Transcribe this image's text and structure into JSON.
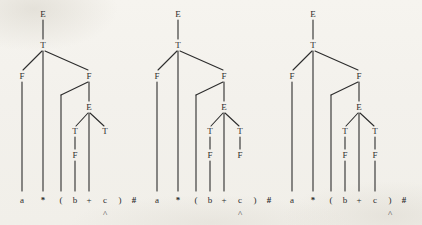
{
  "figure": {
    "background_color": "#f4f2ed",
    "ink_color": "#2c2c2c",
    "width": 422,
    "height": 225,
    "stage_count": 3
  },
  "grammar_symbols": {
    "E": "E",
    "T": "T",
    "F": "F"
  },
  "terminals": {
    "a": "a",
    "star": "*",
    "lparen": "(",
    "b": "b",
    "plus": "+",
    "c": "c",
    "rparen": ")",
    "end": "#"
  },
  "caret_marker": "^",
  "trees": [
    {
      "id": "tree-1",
      "x_offset": 0,
      "caret_under": "c",
      "nodes": [
        {
          "name": "root-E",
          "label": "E",
          "x": 43,
          "y": 14
        },
        {
          "name": "T-under-root",
          "label": "T",
          "x": 43,
          "y": 45
        },
        {
          "name": "F-left",
          "label": "F",
          "x": 22,
          "y": 76
        },
        {
          "name": "F-right",
          "label": "F",
          "x": 89,
          "y": 76
        },
        {
          "name": "E-inner",
          "label": "E",
          "x": 89,
          "y": 107
        },
        {
          "name": "T-inner-left",
          "label": "T",
          "x": 75,
          "y": 131
        },
        {
          "name": "T-inner-right",
          "label": "T",
          "x": 105,
          "y": 131
        },
        {
          "name": "F-inner-left",
          "label": "F",
          "x": 75,
          "y": 155
        }
      ],
      "edges": [
        {
          "name": "edge-root-E-to-T",
          "x1": 43,
          "y1": 20,
          "x2": 43,
          "y2": 39
        },
        {
          "name": "edge-T-to-F-left",
          "x1": 42,
          "y1": 51,
          "x2": 23,
          "y2": 70
        },
        {
          "name": "edge-T-to-star",
          "x1": 43,
          "y1": 51,
          "x2": 43,
          "y2": 191
        },
        {
          "name": "edge-T-to-F-right",
          "x1": 45,
          "y1": 51,
          "x2": 88,
          "y2": 70
        },
        {
          "name": "edge-F-left-to-a",
          "x1": 22,
          "y1": 82,
          "x2": 22,
          "y2": 191
        },
        {
          "name": "edge-F-right-to-lparen",
          "x1": 88,
          "y1": 82,
          "x2": 61,
          "y2": 95
        },
        {
          "name": "edge-lparen-down",
          "x1": 61,
          "y1": 95,
          "x2": 61,
          "y2": 191
        },
        {
          "name": "edge-F-right-to-E-inner",
          "x1": 89,
          "y1": 82,
          "x2": 89,
          "y2": 101
        },
        {
          "name": "edge-E-to-T-left",
          "x1": 88,
          "y1": 113,
          "x2": 76,
          "y2": 126
        },
        {
          "name": "edge-E-to-plus",
          "x1": 89,
          "y1": 113,
          "x2": 89,
          "y2": 191
        },
        {
          "name": "edge-E-to-T-right",
          "x1": 90,
          "y1": 113,
          "x2": 104,
          "y2": 126
        },
        {
          "name": "edge-T-left-to-F",
          "x1": 75,
          "y1": 137,
          "x2": 75,
          "y2": 149
        },
        {
          "name": "edge-F-inner-to-b",
          "x1": 75,
          "y1": 161,
          "x2": 75,
          "y2": 191
        }
      ]
    },
    {
      "id": "tree-2",
      "x_offset": 135,
      "caret_under": "c",
      "nodes": [
        {
          "name": "root-E",
          "label": "E",
          "x": 43,
          "y": 14
        },
        {
          "name": "T-under-root",
          "label": "T",
          "x": 43,
          "y": 45
        },
        {
          "name": "F-left",
          "label": "F",
          "x": 22,
          "y": 76
        },
        {
          "name": "F-right",
          "label": "F",
          "x": 89,
          "y": 76
        },
        {
          "name": "E-inner",
          "label": "E",
          "x": 89,
          "y": 107
        },
        {
          "name": "T-inner-left",
          "label": "T",
          "x": 75,
          "y": 131
        },
        {
          "name": "T-inner-right",
          "label": "T",
          "x": 105,
          "y": 131
        },
        {
          "name": "F-inner-left",
          "label": "F",
          "x": 75,
          "y": 155
        },
        {
          "name": "F-inner-right",
          "label": "F",
          "x": 105,
          "y": 155
        }
      ],
      "edges": [
        {
          "name": "edge-root-E-to-T",
          "x1": 43,
          "y1": 20,
          "x2": 43,
          "y2": 39
        },
        {
          "name": "edge-T-to-F-left",
          "x1": 42,
          "y1": 51,
          "x2": 23,
          "y2": 70
        },
        {
          "name": "edge-T-to-star",
          "x1": 43,
          "y1": 51,
          "x2": 43,
          "y2": 191
        },
        {
          "name": "edge-T-to-F-right",
          "x1": 45,
          "y1": 51,
          "x2": 88,
          "y2": 70
        },
        {
          "name": "edge-F-left-to-a",
          "x1": 22,
          "y1": 82,
          "x2": 22,
          "y2": 191
        },
        {
          "name": "edge-F-right-to-lparen",
          "x1": 88,
          "y1": 82,
          "x2": 61,
          "y2": 95
        },
        {
          "name": "edge-lparen-down",
          "x1": 61,
          "y1": 95,
          "x2": 61,
          "y2": 191
        },
        {
          "name": "edge-F-right-to-E-inner",
          "x1": 89,
          "y1": 82,
          "x2": 89,
          "y2": 101
        },
        {
          "name": "edge-E-to-T-left",
          "x1": 88,
          "y1": 113,
          "x2": 76,
          "y2": 126
        },
        {
          "name": "edge-E-to-plus",
          "x1": 89,
          "y1": 113,
          "x2": 89,
          "y2": 191
        },
        {
          "name": "edge-E-to-T-right",
          "x1": 90,
          "y1": 113,
          "x2": 104,
          "y2": 126
        },
        {
          "name": "edge-T-left-to-F",
          "x1": 75,
          "y1": 137,
          "x2": 75,
          "y2": 149
        },
        {
          "name": "edge-F-inner-to-b",
          "x1": 75,
          "y1": 161,
          "x2": 75,
          "y2": 191
        },
        {
          "name": "edge-T-right-to-F",
          "x1": 105,
          "y1": 137,
          "x2": 105,
          "y2": 149
        }
      ]
    },
    {
      "id": "tree-3",
      "x_offset": 270,
      "caret_under": ")",
      "nodes": [
        {
          "name": "root-E",
          "label": "E",
          "x": 43,
          "y": 14
        },
        {
          "name": "T-under-root",
          "label": "T",
          "x": 43,
          "y": 45
        },
        {
          "name": "F-left",
          "label": "F",
          "x": 22,
          "y": 76
        },
        {
          "name": "F-right",
          "label": "F",
          "x": 89,
          "y": 76
        },
        {
          "name": "E-inner",
          "label": "E",
          "x": 89,
          "y": 107
        },
        {
          "name": "T-inner-left",
          "label": "T",
          "x": 75,
          "y": 131
        },
        {
          "name": "T-inner-right",
          "label": "T",
          "x": 105,
          "y": 131
        },
        {
          "name": "F-inner-left",
          "label": "F",
          "x": 75,
          "y": 155
        },
        {
          "name": "F-inner-right",
          "label": "F",
          "x": 105,
          "y": 155
        }
      ],
      "edges": [
        {
          "name": "edge-root-E-to-T",
          "x1": 43,
          "y1": 20,
          "x2": 43,
          "y2": 39
        },
        {
          "name": "edge-T-to-F-left",
          "x1": 42,
          "y1": 51,
          "x2": 23,
          "y2": 70
        },
        {
          "name": "edge-T-to-star",
          "x1": 43,
          "y1": 51,
          "x2": 43,
          "y2": 191
        },
        {
          "name": "edge-T-to-F-right",
          "x1": 45,
          "y1": 51,
          "x2": 88,
          "y2": 70
        },
        {
          "name": "edge-F-left-to-a",
          "x1": 22,
          "y1": 82,
          "x2": 22,
          "y2": 191
        },
        {
          "name": "edge-F-right-to-lparen",
          "x1": 88,
          "y1": 82,
          "x2": 61,
          "y2": 95
        },
        {
          "name": "edge-lparen-down",
          "x1": 61,
          "y1": 95,
          "x2": 61,
          "y2": 191
        },
        {
          "name": "edge-F-right-to-E-inner",
          "x1": 89,
          "y1": 82,
          "x2": 89,
          "y2": 101
        },
        {
          "name": "edge-E-to-T-left",
          "x1": 88,
          "y1": 113,
          "x2": 76,
          "y2": 126
        },
        {
          "name": "edge-E-to-plus",
          "x1": 89,
          "y1": 113,
          "x2": 89,
          "y2": 191
        },
        {
          "name": "edge-E-to-T-right",
          "x1": 90,
          "y1": 113,
          "x2": 104,
          "y2": 126
        },
        {
          "name": "edge-T-left-to-F",
          "x1": 75,
          "y1": 137,
          "x2": 75,
          "y2": 149
        },
        {
          "name": "edge-F-inner-to-b",
          "x1": 75,
          "y1": 161,
          "x2": 75,
          "y2": 191
        },
        {
          "name": "edge-T-right-to-F",
          "x1": 105,
          "y1": 137,
          "x2": 105,
          "y2": 149
        },
        {
          "name": "edge-F-inner-right-to-c",
          "x1": 105,
          "y1": 161,
          "x2": 105,
          "y2": 191
        }
      ]
    }
  ],
  "terminal_row": {
    "y": 200,
    "caret_y": 214,
    "items": [
      {
        "name": "terminal-a",
        "label": "a",
        "x": 22,
        "bold": false
      },
      {
        "name": "terminal-star",
        "label": "*",
        "x": 43,
        "bold": true
      },
      {
        "name": "terminal-lparen",
        "label": "(",
        "x": 61,
        "bold": false
      },
      {
        "name": "terminal-b",
        "label": "b",
        "x": 75,
        "bold": false
      },
      {
        "name": "terminal-plus",
        "label": "+",
        "x": 89,
        "bold": false
      },
      {
        "name": "terminal-c",
        "label": "c",
        "x": 105,
        "bold": false
      },
      {
        "name": "terminal-rparen",
        "label": ")",
        "x": 120,
        "bold": false
      },
      {
        "name": "terminal-end",
        "label": "#",
        "x": 134,
        "bold": true
      }
    ],
    "caret_x_by_symbol": {
      "c": 105,
      ")": 120
    }
  }
}
